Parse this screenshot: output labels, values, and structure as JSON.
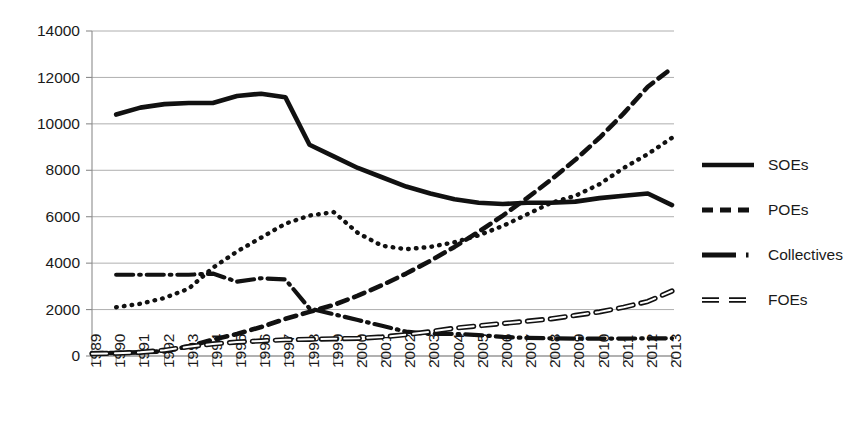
{
  "chart_data": {
    "type": "line",
    "title": "",
    "xlabel": "",
    "ylabel": "",
    "ylim": [
      0,
      14000
    ],
    "ytick_values": [
      0,
      2000,
      4000,
      6000,
      8000,
      10000,
      12000,
      14000
    ],
    "ytick_labels": [
      "0",
      "2000",
      "4000",
      "6000",
      "8000",
      "10000",
      "12000",
      "14000"
    ],
    "grid": true,
    "legend_position": "right",
    "categories": [
      "1989",
      "1990",
      "1991",
      "1992",
      "1993",
      "1994",
      "1995",
      "1996",
      "1997",
      "1998",
      "1999",
      "2000",
      "2001",
      "2002",
      "2003",
      "2004",
      "2005",
      "2006",
      "2007",
      "2008",
      "2009",
      "2010",
      "2011",
      "2012",
      "2013"
    ],
    "series": [
      {
        "name": "SOEs",
        "style": "solid",
        "values": [
          null,
          10400,
          10700,
          10850,
          10900,
          10900,
          11200,
          11300,
          11150,
          9100,
          8600,
          8100,
          7700,
          7300,
          7000,
          6750,
          6600,
          6550,
          6600,
          6600,
          6650,
          6800,
          6900,
          7000,
          6500
        ]
      },
      {
        "name": "POEs",
        "style": "dashed",
        "values": [
          120,
          130,
          160,
          200,
          420,
          700,
          950,
          1250,
          1600,
          1900,
          2200,
          2600,
          3050,
          3550,
          4100,
          4700,
          5350,
          6050,
          6800,
          7600,
          8450,
          9400,
          10450,
          11600,
          12400
        ]
      },
      {
        "name": "Collectives",
        "style": "dash-dot",
        "values": [
          null,
          3500,
          3500,
          3500,
          3500,
          3550,
          3200,
          3350,
          3300,
          2050,
          1800,
          1550,
          1300,
          1050,
          950,
          950,
          900,
          820,
          780,
          760,
          750,
          750,
          750,
          760,
          760
        ]
      },
      {
        "name": "FOEs",
        "style": "double-dash",
        "values": [
          100,
          120,
          160,
          250,
          400,
          520,
          600,
          650,
          700,
          720,
          740,
          760,
          820,
          920,
          1050,
          1200,
          1300,
          1400,
          1500,
          1600,
          1750,
          1900,
          2100,
          2350,
          2800
        ]
      },
      {
        "name": "Dotted (unlabeled)",
        "style": "dotted",
        "values": [
          null,
          2100,
          2250,
          2500,
          2900,
          3800,
          4500,
          5100,
          5700,
          6050,
          6200,
          5300,
          4750,
          4600,
          4700,
          4900,
          5200,
          5600,
          6100,
          6600,
          6900,
          7400,
          8100,
          8700,
          9400
        ]
      }
    ],
    "legend": [
      {
        "label": "SOEs",
        "style": "solid"
      },
      {
        "label": "POEs",
        "style": "dashed"
      },
      {
        "label": "Collectives",
        "style": "dash-dot"
      },
      {
        "label": "FOEs",
        "style": "double-dash"
      }
    ]
  },
  "colors": {
    "ink": "#111111",
    "grid": "#9a9a9a",
    "axis": "#8c8c8c",
    "background": "#ffffff"
  }
}
